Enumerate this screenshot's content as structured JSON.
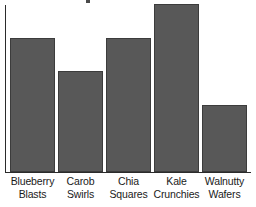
{
  "chart_data": {
    "type": "bar",
    "title": "",
    "xlabel": "",
    "ylabel": "",
    "categories": [
      "Blueberry Blasts",
      "Carob Swirls",
      "Chia Squares",
      "Kale Crunchies",
      "Walnutty Wafers"
    ],
    "category_lines": [
      [
        "Blueberry",
        "Blasts"
      ],
      [
        "Carob",
        "Swirls"
      ],
      [
        "Chia",
        "Squares"
      ],
      [
        "Kale",
        "Crunchies"
      ],
      [
        "Walnutty",
        "Wafers"
      ]
    ],
    "values": [
      0.8,
      0.6,
      0.79,
      1.0,
      0.4
    ],
    "ylim": [
      0,
      1.0
    ],
    "grid": false,
    "legend": false,
    "axis_tick_labels": [],
    "bar_color": "#585858",
    "bar_outline_color": "#3c3c3c",
    "axis_color": "#2b2b2b",
    "background_color": "#ffffff"
  },
  "chart": {
    "title_fragment": "",
    "bars": [
      {
        "name": "blueberry-blasts",
        "line1": "Blueberry",
        "line2": "Blasts",
        "x": 10,
        "width": 45,
        "top": 38,
        "height": 134
      },
      {
        "name": "carob-swirls",
        "line1": "Carob",
        "line2": "Swirls",
        "x": 58,
        "width": 45,
        "top": 71,
        "height": 101
      },
      {
        "name": "chia-squares",
        "line1": "Chia",
        "line2": "Squares",
        "x": 106,
        "width": 45,
        "top": 38,
        "height": 134
      },
      {
        "name": "kale-crunchies",
        "line1": "Kale",
        "line2": "Crunchies",
        "x": 154,
        "width": 45,
        "top": 4,
        "height": 168
      },
      {
        "name": "walnutty-wafers",
        "line1": "Walnutty",
        "line2": "Wafers",
        "x": 202,
        "width": 45,
        "top": 105,
        "height": 67
      }
    ]
  }
}
